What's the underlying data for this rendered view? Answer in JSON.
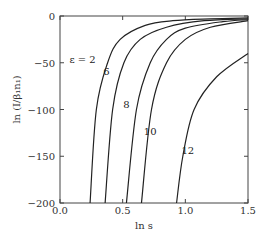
{
  "chart_data": {
    "type": "line",
    "title": "",
    "xlabel": "ln s",
    "ylabel": "ln (I/β₁n₁)",
    "xlim": [
      0.0,
      1.5
    ],
    "ylim": [
      -200,
      0
    ],
    "xticks": [
      0.0,
      0.5,
      1.0,
      1.5
    ],
    "xtick_labels": [
      "0.0",
      "0.5",
      "1.0",
      "1.5"
    ],
    "yticks": [
      0,
      -50,
      -100,
      -150,
      -200
    ],
    "ytick_labels": [
      "0",
      "−50",
      "−100",
      "−150",
      "−200"
    ],
    "grid": false,
    "legend": "none (inline curve labels)",
    "series": [
      {
        "name": "ε = 2",
        "label": "ε = 2",
        "x": [
          0.24,
          0.29,
          0.38,
          0.48,
          0.68,
          0.9,
          1.2,
          1.5
        ],
        "y": [
          -200,
          -100,
          -50,
          -25,
          -10,
          -5,
          -3,
          -2
        ]
      },
      {
        "name": "6",
        "label": "6",
        "x": [
          0.36,
          0.42,
          0.51,
          0.64,
          0.85,
          1.15,
          1.5
        ],
        "y": [
          -200,
          -100,
          -50,
          -25,
          -12,
          -5,
          -3
        ]
      },
      {
        "name": "8",
        "label": "8",
        "x": [
          0.53,
          0.61,
          0.72,
          0.85,
          1.0,
          1.3,
          1.5
        ],
        "y": [
          -200,
          -100,
          -50,
          -25,
          -13,
          -6,
          -4
        ]
      },
      {
        "name": "10",
        "label": "10",
        "x": [
          0.65,
          0.73,
          0.85,
          1.0,
          1.2,
          1.5
        ],
        "y": [
          -200,
          -100,
          -50,
          -25,
          -12,
          -5
        ]
      },
      {
        "name": "12",
        "label": "12",
        "x": [
          0.93,
          0.98,
          1.07,
          1.25,
          1.5
        ],
        "y": [
          -200,
          -150,
          -100,
          -65,
          -40
        ]
      }
    ]
  }
}
